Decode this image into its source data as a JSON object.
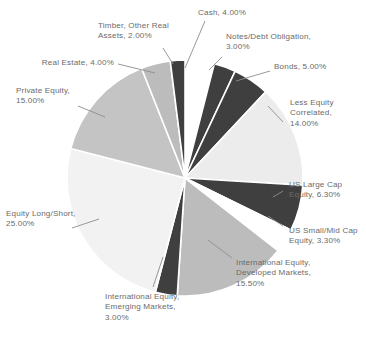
{
  "chart_data": {
    "type": "pie",
    "title": "",
    "subtitle": "",
    "xlabel": "",
    "ylabel": "",
    "legend_position": "none",
    "grid": false,
    "labels_show_percent": true,
    "start_angle_deg": 0,
    "direction": "clockwise",
    "categories": [
      "Cash",
      "Notes/Debt Obligation",
      "Bonds",
      "Less Equity Correlated",
      "US Large Cap Equity",
      "US Small/Mid Cap Equity",
      "International Equity, Developed Markets",
      "International Equity, Emerging Markets",
      "Equity Long/Short",
      "Private Equity",
      "Real Estate",
      "Timber, Other Real Assets"
    ],
    "values": [
      4.0,
      3.0,
      5.0,
      14.0,
      6.3,
      3.3,
      15.5,
      3.0,
      25.0,
      15.0,
      4.0,
      2.0
    ],
    "colors": [
      "#ffffff",
      "#3f3f3f",
      "#3f3f3f",
      "#ececec",
      "#3f3f3f",
      "#ffffff",
      "#bcbcbc",
      "#3f3f3f",
      "#f2f2f2",
      "#c4c4c4",
      "#bcbcbc",
      "#3f3f3f"
    ],
    "slices": [
      {
        "name": "Cash",
        "value": 4.0,
        "color": "#ffffff"
      },
      {
        "name": "Notes/Debt Obligation",
        "value": 3.0,
        "color": "#3f3f3f"
      },
      {
        "name": "Bonds",
        "value": 5.0,
        "color": "#3f3f3f"
      },
      {
        "name": "Less Equity Correlated",
        "value": 14.0,
        "color": "#ececec"
      },
      {
        "name": "US Large Cap Equity",
        "value": 6.3,
        "color": "#3f3f3f"
      },
      {
        "name": "US Small/Mid Cap Equity",
        "value": 3.3,
        "color": "#ffffff"
      },
      {
        "name": "International Equity, Developed Markets",
        "value": 15.5,
        "color": "#bcbcbc"
      },
      {
        "name": "International Equity, Emerging Markets",
        "value": 3.0,
        "color": "#3f3f3f"
      },
      {
        "name": "Equity Long/Short",
        "value": 25.0,
        "color": "#f2f2f2"
      },
      {
        "name": "Private Equity",
        "value": 15.0,
        "color": "#c4c4c4"
      },
      {
        "name": "Real Estate",
        "value": 4.0,
        "color": "#bcbcbc"
      },
      {
        "name": "Timber, Other Real Assets",
        "value": 2.0,
        "color": "#3f3f3f"
      }
    ]
  },
  "labels": {
    "cash": "Cash, 4.00%",
    "notes_debt": "Notes/Debt Obligation,\n3.00%",
    "bonds": "Bonds, 5.00%",
    "less_equity_correlated": "Less Equity\nCorrelated,\n14.00%",
    "us_large_cap": "US Large Cap\nEquity, 6.30%",
    "us_small_mid_cap": "US Small/Mid Cap\nEquity, 3.30%",
    "intl_developed": "International Equity,\nDeveloped Markets,\n15.50%",
    "intl_emerging": "International Equity,\nEmerging Markets,\n3.00%",
    "equity_long_short": "Equity Long/Short,\n25.00%",
    "private_equity": "Private Equity,\n15.00%",
    "real_estate": "Real Estate, 4.00%",
    "timber_other": "Timber, Other Real\nAssets, 2.00%"
  }
}
